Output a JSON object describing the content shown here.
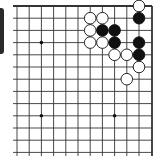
{
  "board": {
    "type": "go-diagram",
    "corner": "top-right",
    "grid": {
      "x0": 17,
      "y0": 6,
      "spacing": 12.2,
      "cols": 12,
      "rows": 13,
      "right_edge_x": 152,
      "line_color": "#333333"
    },
    "star_points": [
      [
        2,
        3
      ],
      [
        2,
        9
      ],
      [
        8,
        9
      ]
    ],
    "stones": [
      {
        "color": "white",
        "col": 10,
        "row": 0
      },
      {
        "color": "black",
        "col": 10,
        "row": 1
      },
      {
        "color": "white",
        "col": 6,
        "row": 1
      },
      {
        "color": "white",
        "col": 7,
        "row": 1
      },
      {
        "color": "white",
        "col": 6,
        "row": 2
      },
      {
        "color": "black",
        "col": 7,
        "row": 2
      },
      {
        "color": "black",
        "col": 8,
        "row": 2
      },
      {
        "color": "white",
        "col": 6,
        "row": 3
      },
      {
        "color": "white",
        "col": 7,
        "row": 3
      },
      {
        "color": "black",
        "col": 8,
        "row": 3
      },
      {
        "color": "black",
        "col": 10,
        "row": 3
      },
      {
        "color": "white",
        "col": 8,
        "row": 4
      },
      {
        "color": "white",
        "col": 9,
        "row": 4
      },
      {
        "color": "black",
        "col": 10,
        "row": 4
      },
      {
        "color": "white",
        "col": 10,
        "row": 5
      },
      {
        "color": "white",
        "col": 9,
        "row": 6
      }
    ],
    "colors": {
      "black_stone": "#111111",
      "white_stone": "#ffffff",
      "stone_outline": "#111111"
    }
  }
}
